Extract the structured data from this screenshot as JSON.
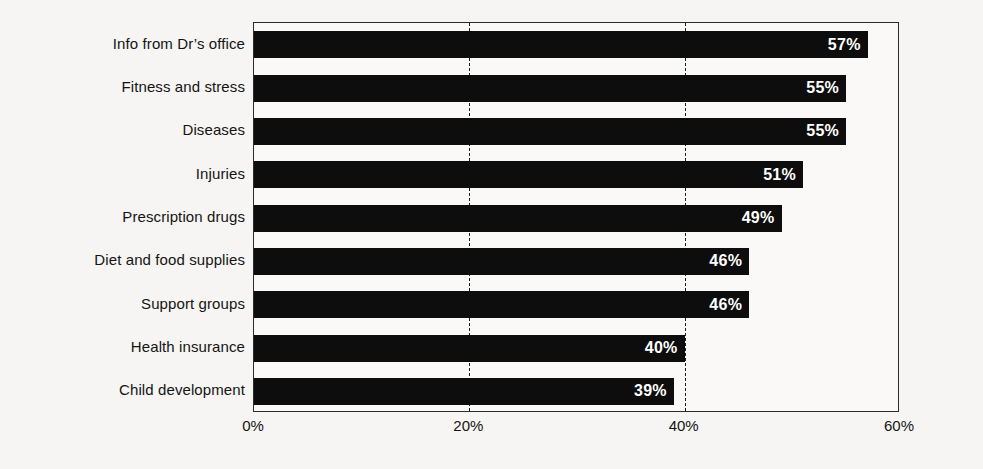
{
  "chart_data": {
    "type": "bar",
    "orientation": "horizontal",
    "title": "",
    "subtitle": "",
    "xlabel": "",
    "ylabel": "",
    "xlim": [
      0,
      60
    ],
    "xticks": [
      0,
      20,
      40,
      60
    ],
    "xtick_labels": [
      "0%",
      "20%",
      "40%",
      "60%"
    ],
    "grid": "vertical-dashed",
    "legend": "none",
    "value_label_position": "inside-end",
    "bar_color": "#0d0d0d",
    "value_label_color": "#ffffff",
    "background_color": "#f6f5f3",
    "plot_background_color": "#faf9f7",
    "axis_color": "#2b2b2b",
    "categories": [
      "Info from Dr’s office",
      "Fitness and stress",
      "Diseases",
      "Injuries",
      "Prescription drugs",
      "Diet and food supplies",
      "Support groups",
      "Health insurance",
      "Child development"
    ],
    "values": [
      57,
      55,
      55,
      51,
      49,
      46,
      46,
      40,
      39
    ],
    "value_labels": [
      "57%",
      "55%",
      "55%",
      "51%",
      "49%",
      "46%",
      "46%",
      "40%",
      "39%"
    ]
  }
}
